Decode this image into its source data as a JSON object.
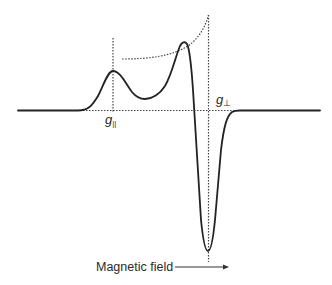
{
  "diagram": {
    "type": "EPR derivative spectrum (axial g-tensor)",
    "labels": {
      "g_parallel": "g",
      "g_parallel_sub": "||",
      "g_perp": "g",
      "g_perp_sub": "⊥",
      "x_axis": "Magnetic field"
    },
    "colors": {
      "line": "#222222",
      "dotted": "#444444",
      "background": "#ffffff"
    }
  }
}
